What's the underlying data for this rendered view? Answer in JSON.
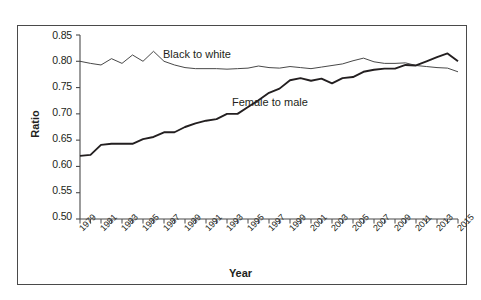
{
  "chart_data": {
    "type": "line",
    "title": "",
    "xlabel": "Year",
    "ylabel": "Ratio",
    "xlim": [
      1979,
      2015
    ],
    "ylim": [
      0.5,
      0.85
    ],
    "grid": false,
    "legend_position": "inline-annotation",
    "ytick_labels": [
      "0.85",
      "0.80",
      "0.75",
      "0.70",
      "0.65",
      "0.60",
      "0.55",
      "0.50"
    ],
    "ytick_values": [
      0.85,
      0.8,
      0.75,
      0.7,
      0.65,
      0.6,
      0.55,
      0.5
    ],
    "xtick_labels": [
      "1979",
      "1981",
      "1983",
      "1985",
      "1987",
      "1989",
      "1991",
      "1993",
      "1995",
      "1997",
      "1999",
      "2001",
      "2003",
      "2005",
      "2007",
      "2009",
      "2011",
      "2013",
      "2015"
    ],
    "xtick_values": [
      1979,
      1981,
      1983,
      1985,
      1987,
      1989,
      1991,
      1993,
      1995,
      1997,
      1999,
      2001,
      2003,
      2005,
      2007,
      2009,
      2011,
      2013,
      2015
    ],
    "x": [
      1979,
      1980,
      1981,
      1982,
      1983,
      1984,
      1985,
      1986,
      1987,
      1988,
      1989,
      1990,
      1991,
      1992,
      1993,
      1994,
      1995,
      1996,
      1997,
      1998,
      1999,
      2000,
      2001,
      2002,
      2003,
      2004,
      2005,
      2006,
      2007,
      2008,
      2009,
      2010,
      2011,
      2012,
      2013,
      2014,
      2015
    ],
    "series": [
      {
        "name": "Black to white",
        "style": "thin",
        "color": "#333333",
        "values": [
          0.8,
          0.796,
          0.793,
          0.805,
          0.796,
          0.812,
          0.8,
          0.819,
          0.8,
          0.793,
          0.788,
          0.786,
          0.786,
          0.786,
          0.785,
          0.786,
          0.787,
          0.791,
          0.788,
          0.787,
          0.79,
          0.788,
          0.786,
          0.789,
          0.792,
          0.795,
          0.801,
          0.806,
          0.799,
          0.796,
          0.796,
          0.797,
          0.792,
          0.79,
          0.788,
          0.787,
          0.78
        ]
      },
      {
        "name": "Female to male",
        "style": "thick",
        "color": "#231f20",
        "values": [
          0.62,
          0.622,
          0.641,
          0.643,
          0.643,
          0.643,
          0.652,
          0.656,
          0.665,
          0.665,
          0.675,
          0.682,
          0.687,
          0.69,
          0.7,
          0.7,
          0.713,
          0.726,
          0.74,
          0.748,
          0.764,
          0.768,
          0.763,
          0.767,
          0.758,
          0.768,
          0.77,
          0.78,
          0.784,
          0.786,
          0.786,
          0.793,
          0.792,
          0.8,
          0.808,
          0.815,
          0.8
        ]
      }
    ],
    "annotations": [
      {
        "text": "Black to white",
        "x": 1991.5,
        "y": 0.825
      },
      {
        "text": "Female to male",
        "x": 1998.0,
        "y": 0.735
      }
    ]
  },
  "axes": {
    "ylabel": "Ratio",
    "xlabel": "Year"
  }
}
